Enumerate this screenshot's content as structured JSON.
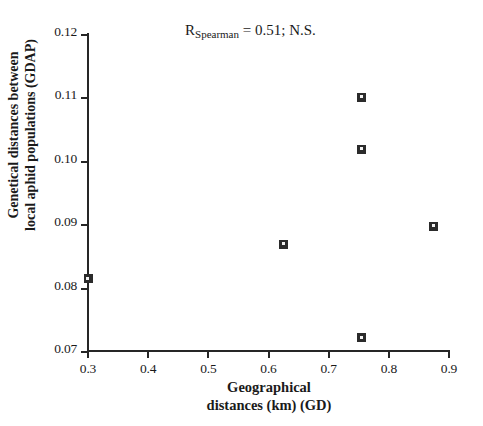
{
  "chart_data": {
    "type": "scatter",
    "title": "",
    "xlabel": "Geographical\ndistances (km) (GD)",
    "ylabel": "Genetical distances between\nlocal aphid populations (GDAP)",
    "xlim": [
      0.3,
      0.9
    ],
    "ylim": [
      0.07,
      0.12
    ],
    "xticks": [
      "0.3",
      "0.4",
      "0.5",
      "0.6",
      "0.7",
      "0.8",
      "0.9"
    ],
    "xtick_values": [
      0.3,
      0.4,
      0.5,
      0.6,
      0.7,
      0.8,
      0.9
    ],
    "yticks": [
      "0.07",
      "0.08",
      "0.09",
      "0.10",
      "0.11",
      "0.12"
    ],
    "ytick_values": [
      0.07,
      0.08,
      0.09,
      0.1,
      0.11,
      0.12
    ],
    "grid": false,
    "legend": null,
    "marker": "open-square",
    "marker_color": "#2b2b2b",
    "points": [
      {
        "x": 0.3,
        "y": 0.0814
      },
      {
        "x": 0.625,
        "y": 0.0868
      },
      {
        "x": 0.755,
        "y": 0.11
      },
      {
        "x": 0.755,
        "y": 0.1018
      },
      {
        "x": 0.755,
        "y": 0.0721
      },
      {
        "x": 0.875,
        "y": 0.0897
      }
    ],
    "annotations": [
      {
        "id": "spearman-stat",
        "prefix": "R",
        "subscript": "Spearman",
        "suffix": " = 0.51; N.S.",
        "text": "RSpearman = 0.51; N.S."
      }
    ]
  },
  "figure": {
    "background": "#ffffff",
    "axis_color": "#262626",
    "text_color": "#1a1a1a"
  }
}
